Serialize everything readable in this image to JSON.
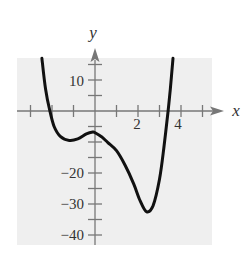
{
  "chart_data": {
    "type": "line",
    "title": "",
    "xlabel": "x",
    "ylabel": "y",
    "xlim": [
      -3.6,
      5.9
    ],
    "ylim": [
      -43,
      17
    ],
    "x_ticks": [
      -3,
      -2,
      -1,
      0,
      1,
      2,
      3,
      4,
      5
    ],
    "x_tick_labels": [
      {
        "value": 2,
        "label": "2"
      },
      {
        "value": 4,
        "label": "4"
      }
    ],
    "y_ticks": [
      15,
      10,
      5,
      0,
      -5,
      -10,
      -15,
      -20,
      -25,
      -30,
      -35,
      -40
    ],
    "y_tick_labels": [
      {
        "value": 10,
        "label": "10"
      },
      {
        "value": -20,
        "label": "−20"
      },
      {
        "value": -30,
        "label": "−30"
      },
      {
        "value": -40,
        "label": "−40"
      }
    ],
    "grid": false,
    "background": "#efefef",
    "series": [
      {
        "name": "f(x)",
        "color": "#111111",
        "points": [
          [
            -2.47,
            17
          ],
          [
            -2.3,
            7
          ],
          [
            -2.1,
            0
          ],
          [
            -1.9,
            -5
          ],
          [
            -1.6,
            -8.3
          ],
          [
            -1.2,
            -9.5
          ],
          [
            -0.8,
            -9.0
          ],
          [
            -0.4,
            -7.4
          ],
          [
            -0.1,
            -6.8
          ],
          [
            0.0,
            -7.0
          ],
          [
            0.3,
            -8.3
          ],
          [
            0.6,
            -10.2
          ],
          [
            1.0,
            -12.8
          ],
          [
            1.4,
            -17.5
          ],
          [
            1.8,
            -23.5
          ],
          [
            2.1,
            -29
          ],
          [
            2.4,
            -32.5
          ],
          [
            2.7,
            -30.5
          ],
          [
            3.0,
            -22
          ],
          [
            3.2,
            -12
          ],
          [
            3.4,
            0
          ],
          [
            3.5,
            7
          ],
          [
            3.63,
            17
          ]
        ]
      }
    ],
    "key_points": {
      "x_intercepts": [
        -2.1,
        3.4
      ],
      "y_intercept": -7,
      "local_min": [
        -1.2,
        -9.5
      ],
      "local_max": [
        -0.1,
        -6.8
      ],
      "global_min": [
        2.4,
        -32.5
      ]
    }
  },
  "labels": {
    "x_axis": "x",
    "y_axis": "y",
    "x2": "2",
    "x4": "4",
    "y10": "10",
    "ym20": "−20",
    "ym30": "−30",
    "ym40": "−40"
  }
}
